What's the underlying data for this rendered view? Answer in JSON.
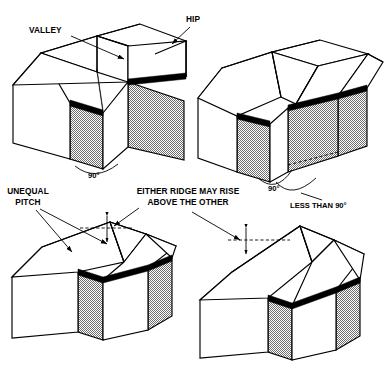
{
  "figure": {
    "background_color": "#ffffff",
    "line_color": "#000000",
    "wall_fill": "checkerboard-stipple-gray",
    "width": 386,
    "height": 365
  },
  "labels": {
    "valley": "VALLEY",
    "hip": "HIP",
    "unequal_pitch_line1": "UNEQUAL",
    "unequal_pitch_line2": "PITCH",
    "either_ridge_line1": "EITHER RIDGE MAY RISE",
    "either_ridge_line2": "ABOVE THE OTHER",
    "angle_right_tl": "90°",
    "angle_right_tr": "90°",
    "angle_less_tr": "LESS THAN 90°"
  },
  "panels": [
    {
      "id": "top-left",
      "name": "equal-pitch-right-angle-intersection",
      "callouts": [
        "VALLEY",
        "HIP",
        "90°"
      ]
    },
    {
      "id": "top-right",
      "name": "oblique-angle-intersection",
      "callouts": [
        "90°",
        "LESS THAN 90°"
      ]
    },
    {
      "id": "bottom-left",
      "name": "unequal-pitch-intersection",
      "callouts": [
        "UNEQUAL PITCH",
        "EITHER RIDGE MAY RISE ABOVE THE OTHER"
      ]
    },
    {
      "id": "bottom-right",
      "name": "unequal-ridge-height-intersection",
      "callouts": [
        "EITHER RIDGE MAY RISE ABOVE THE OTHER"
      ]
    }
  ]
}
